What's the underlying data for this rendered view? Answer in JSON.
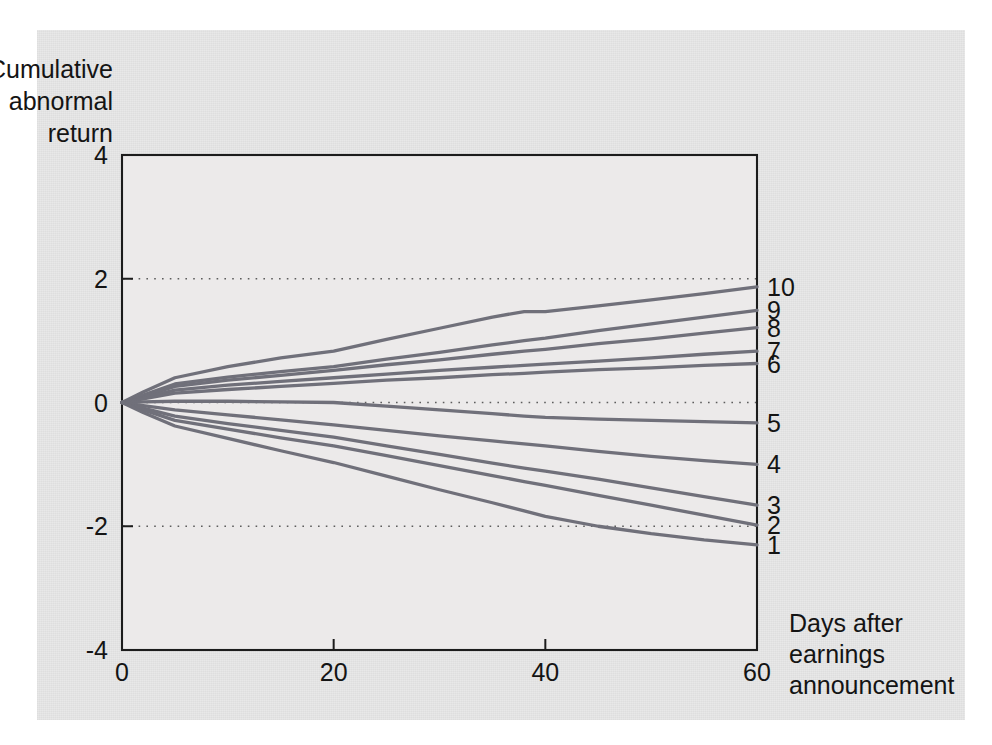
{
  "figure": {
    "background_color": "#e8e8e8",
    "plot_background_color": "#eceaea",
    "line_color": "#70707a",
    "axis_color": "#1c1c1c"
  },
  "chart_data": {
    "type": "line",
    "title": "",
    "subtitle": "",
    "ylabel_lines": [
      "Cumulative",
      "abnormal",
      "return"
    ],
    "xlabel_lines": [
      "Days after",
      "earnings",
      "announcement"
    ],
    "xlabel": "Days after earnings announcement",
    "ylabel": "Cumulative abnormal return",
    "xlim": [
      0,
      60
    ],
    "ylim": [
      -4,
      4
    ],
    "xticks": [
      0,
      20,
      40,
      60
    ],
    "xtick_labels": [
      "0",
      "20",
      "40",
      "60"
    ],
    "yticks": [
      4,
      2,
      0,
      -2,
      -4
    ],
    "ytick_labels": [
      "4",
      "2",
      "0",
      "-2",
      "-4"
    ],
    "gridlines_y": [
      2,
      0,
      -2
    ],
    "grid": "dotted-horizontal",
    "legend_position": "right-end-of-line",
    "x": [
      0,
      2,
      5,
      10,
      15,
      20,
      25,
      30,
      35,
      38,
      40,
      45,
      50,
      55,
      60
    ],
    "series": [
      {
        "name": "10",
        "label": "10",
        "values": [
          0,
          0.17,
          0.4,
          0.58,
          0.72,
          0.83,
          1.02,
          1.2,
          1.38,
          1.47,
          1.47,
          1.56,
          1.66,
          1.76,
          1.87
        ]
      },
      {
        "name": "9",
        "label": "9",
        "values": [
          0,
          0.12,
          0.3,
          0.41,
          0.5,
          0.58,
          0.7,
          0.81,
          0.93,
          1.0,
          1.04,
          1.16,
          1.27,
          1.38,
          1.49
        ]
      },
      {
        "name": "8",
        "label": "8",
        "values": [
          0,
          0.1,
          0.26,
          0.36,
          0.44,
          0.52,
          0.61,
          0.69,
          0.78,
          0.83,
          0.86,
          0.95,
          1.03,
          1.12,
          1.21
        ]
      },
      {
        "name": "7",
        "label": "7",
        "values": [
          0,
          0.08,
          0.2,
          0.28,
          0.34,
          0.4,
          0.46,
          0.52,
          0.57,
          0.6,
          0.62,
          0.67,
          0.72,
          0.78,
          0.83
        ]
      },
      {
        "name": "6",
        "label": "6",
        "values": [
          0,
          0.06,
          0.15,
          0.21,
          0.26,
          0.31,
          0.36,
          0.4,
          0.45,
          0.47,
          0.49,
          0.53,
          0.56,
          0.6,
          0.63
        ]
      },
      {
        "name": "5",
        "label": "5",
        "values": [
          0,
          0.01,
          0.02,
          0.02,
          0.01,
          0.0,
          -0.06,
          -0.12,
          -0.18,
          -0.22,
          -0.24,
          -0.27,
          -0.29,
          -0.31,
          -0.33
        ]
      },
      {
        "name": "4",
        "label": "4",
        "values": [
          0,
          -0.05,
          -0.12,
          -0.2,
          -0.28,
          -0.36,
          -0.45,
          -0.54,
          -0.62,
          -0.67,
          -0.7,
          -0.79,
          -0.87,
          -0.94,
          -1.0
        ]
      },
      {
        "name": "3",
        "label": "3",
        "values": [
          0,
          -0.09,
          -0.22,
          -0.34,
          -0.45,
          -0.56,
          -0.7,
          -0.84,
          -0.98,
          -1.06,
          -1.11,
          -1.24,
          -1.38,
          -1.52,
          -1.66
        ]
      },
      {
        "name": "2",
        "label": "2",
        "values": [
          0,
          -0.12,
          -0.29,
          -0.43,
          -0.57,
          -0.7,
          -0.86,
          -1.02,
          -1.18,
          -1.28,
          -1.34,
          -1.5,
          -1.66,
          -1.82,
          -1.98
        ]
      },
      {
        "name": "1",
        "label": "1",
        "values": [
          0,
          -0.16,
          -0.38,
          -0.58,
          -0.78,
          -0.97,
          -1.19,
          -1.41,
          -1.62,
          -1.75,
          -1.84,
          -2.0,
          -2.12,
          -2.22,
          -2.3
        ]
      }
    ]
  }
}
